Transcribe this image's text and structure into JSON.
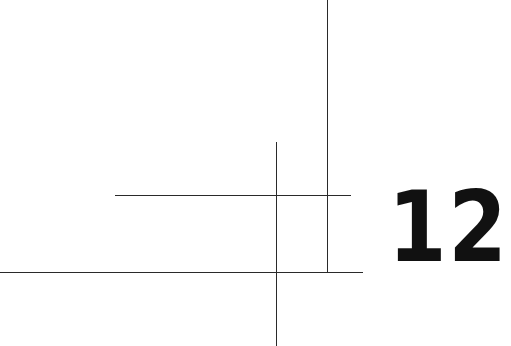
{
  "page": {
    "chapter_number": "12",
    "background_color": "#ffffff",
    "ink_color": "#111111"
  },
  "decoration": {
    "lines": [
      {
        "name": "upper-horizontal-rule",
        "orientation": "horizontal",
        "x1": 115,
        "x2": 351,
        "y": 195
      },
      {
        "name": "lower-horizontal-rule",
        "orientation": "horizontal",
        "x1": 0,
        "x2": 363,
        "y": 272
      },
      {
        "name": "left-vertical-rule",
        "orientation": "vertical",
        "x": 276,
        "y1": 142,
        "y2": 346
      },
      {
        "name": "right-vertical-rule",
        "orientation": "vertical",
        "x": 327,
        "y1": 0,
        "y2": 272
      }
    ]
  }
}
